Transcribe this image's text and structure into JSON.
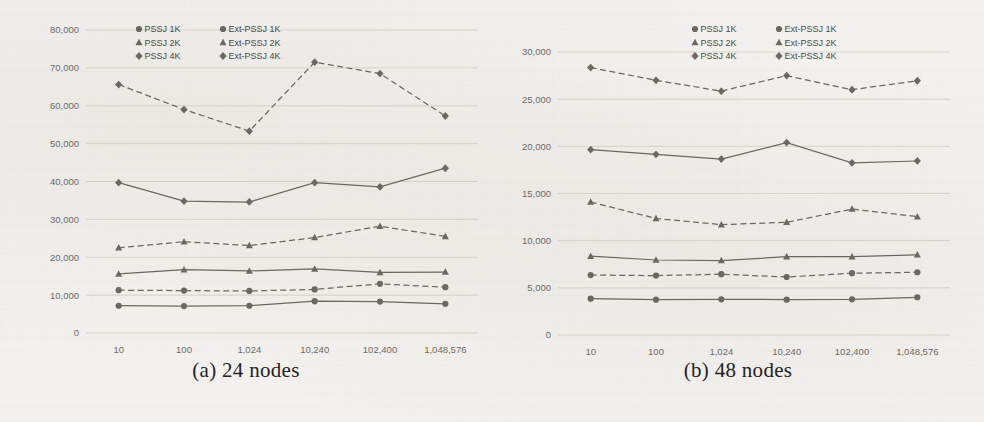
{
  "figure": {
    "panels": [
      {
        "id": "panel-a",
        "caption": "(a) 24 nodes",
        "legend": {
          "entries": [
            {
              "label": "PSSJ 1K",
              "marker": "circle-marker",
              "style": "solid"
            },
            {
              "label": "Ext-PSSJ 1K",
              "marker": "circle-marker",
              "style": "dashed"
            },
            {
              "label": "PSSJ 2K",
              "marker": "triangle-marker",
              "style": "solid"
            },
            {
              "label": "Ext-PSSJ 2K",
              "marker": "triangle-marker",
              "style": "dashed"
            },
            {
              "label": "PSSJ 4K",
              "marker": "diamond-marker",
              "style": "solid"
            },
            {
              "label": "Ext-PSSJ 4K",
              "marker": "diamond-marker",
              "style": "dashed"
            }
          ]
        },
        "chart_data": {
          "type": "line",
          "title": "",
          "xlabel": "",
          "ylabel": "",
          "categories": [
            "10",
            "100",
            "1,024",
            "10,240",
            "102,400",
            "1,048,576"
          ],
          "ylim": [
            0,
            80000
          ],
          "yticks": [
            "0",
            "10,000",
            "20,000",
            "30,000",
            "40,000",
            "50,000",
            "60,000",
            "70,000",
            "80,000"
          ],
          "ytick_values": [
            0,
            10000,
            20000,
            30000,
            40000,
            50000,
            60000,
            70000,
            80000
          ],
          "grid": true,
          "legend_position": "top-center",
          "series": [
            {
              "name": "PSSJ 1K",
              "marker": "circle",
              "style": "solid",
              "values": [
                7200,
                7100,
                7200,
                8400,
                8300,
                7700
              ]
            },
            {
              "name": "Ext-PSSJ 1K",
              "marker": "circle",
              "style": "dashed",
              "values": [
                11300,
                11200,
                11100,
                11500,
                13000,
                12100
              ]
            },
            {
              "name": "PSSJ 2K",
              "marker": "triangle",
              "style": "solid",
              "values": [
                15600,
                16700,
                16400,
                16900,
                16000,
                16100
              ]
            },
            {
              "name": "Ext-PSSJ 2K",
              "marker": "triangle",
              "style": "dashed",
              "values": [
                22500,
                24100,
                23100,
                25200,
                28200,
                25500
              ]
            },
            {
              "name": "PSSJ 4K",
              "marker": "diamond",
              "style": "solid",
              "values": [
                39700,
                34800,
                34600,
                39700,
                38600,
                43500
              ]
            },
            {
              "name": "Ext-PSSJ 4K",
              "marker": "diamond",
              "style": "dashed",
              "values": [
                65600,
                59000,
                53300,
                71500,
                68500,
                57300
              ]
            }
          ]
        }
      },
      {
        "id": "panel-b",
        "caption": "(b) 48 nodes",
        "legend": {
          "entries": [
            {
              "label": "PSSJ 1K",
              "marker": "circle-marker",
              "style": "solid"
            },
            {
              "label": "Ext-PSSJ 1K",
              "marker": "circle-marker",
              "style": "dashed"
            },
            {
              "label": "PSSJ 2K",
              "marker": "triangle-marker",
              "style": "solid"
            },
            {
              "label": "Ext-PSSJ 2K",
              "marker": "triangle-marker",
              "style": "dashed"
            },
            {
              "label": "PSSJ 4K",
              "marker": "diamond-marker",
              "style": "solid"
            },
            {
              "label": "Ext-PSSJ 4K",
              "marker": "diamond-marker",
              "style": "dashed"
            }
          ]
        },
        "chart_data": {
          "type": "line",
          "title": "",
          "xlabel": "",
          "ylabel": "",
          "categories": [
            "10",
            "100",
            "1,024",
            "10,240",
            "102,400",
            "1,048,576"
          ],
          "ylim": [
            0,
            30000
          ],
          "yticks": [
            "0",
            "5,000",
            "10,000",
            "15,000",
            "20,000",
            "25,000",
            "30,000"
          ],
          "ytick_values": [
            0,
            5000,
            10000,
            15000,
            20000,
            25000,
            30000
          ],
          "grid": true,
          "legend_position": "top-right",
          "series": [
            {
              "name": "PSSJ 1K",
              "marker": "circle",
              "style": "solid",
              "values": [
                3850,
                3750,
                3780,
                3750,
                3780,
                4000
              ]
            },
            {
              "name": "Ext-PSSJ 1K",
              "marker": "circle",
              "style": "dashed",
              "values": [
                6350,
                6300,
                6450,
                6150,
                6550,
                6650
              ]
            },
            {
              "name": "PSSJ 2K",
              "marker": "triangle",
              "style": "solid",
              "values": [
                8350,
                7950,
                7900,
                8300,
                8300,
                8500
              ]
            },
            {
              "name": "Ext-PSSJ 2K",
              "marker": "triangle",
              "style": "dashed",
              "values": [
                14100,
                12350,
                11700,
                11950,
                13350,
                12550
              ]
            },
            {
              "name": "PSSJ 4K",
              "marker": "diamond",
              "style": "solid",
              "values": [
                19650,
                19150,
                18650,
                20400,
                18250,
                18450
              ]
            },
            {
              "name": "Ext-PSSJ 4K",
              "marker": "diamond",
              "style": "dashed",
              "values": [
                28350,
                27000,
                25850,
                27500,
                26000,
                26950
              ]
            }
          ]
        }
      }
    ]
  }
}
